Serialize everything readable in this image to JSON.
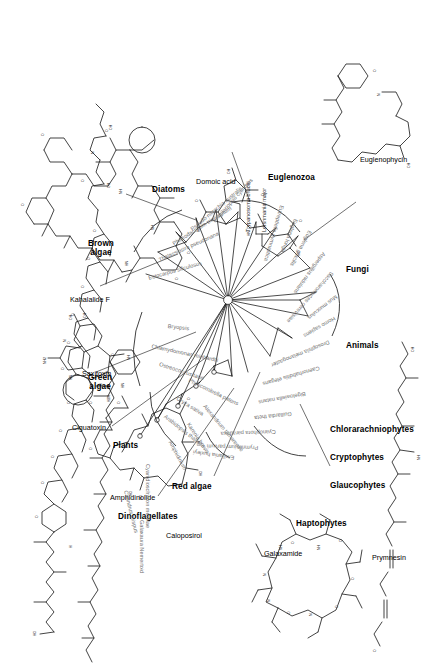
{
  "figure": {
    "type": "phylogenetic-tree-with-chemical-structures",
    "orientation": "rotated-90-ccw"
  },
  "groups": [
    {
      "id": "red-algae",
      "label": "Red algae"
    },
    {
      "id": "dinoflagellates",
      "label": "Dinoflagellates"
    },
    {
      "id": "plants",
      "label": "Plants"
    },
    {
      "id": "green-algae",
      "label": "Green\nalgae"
    },
    {
      "id": "brown-algae",
      "label": "Brown\nalgae"
    },
    {
      "id": "diatoms",
      "label": "Diatoms"
    },
    {
      "id": "euglenozoa",
      "label": "Euglenozoa"
    },
    {
      "id": "fungi",
      "label": "Fungi"
    },
    {
      "id": "animals",
      "label": "Animals"
    },
    {
      "id": "chlorarachniophytes",
      "label": "Chlorarachniophytes"
    },
    {
      "id": "cryptophytes",
      "label": "Cryptophytes"
    },
    {
      "id": "glaucophytes",
      "label": "Glaucophytes"
    },
    {
      "id": "haptophytes",
      "label": "Haptophytes"
    }
  ],
  "taxa": [
    {
      "id": "t01",
      "name": "Galaxaura Nemertoid",
      "group": "red-algae"
    },
    {
      "id": "t02",
      "name": "Chondrus crispus",
      "group": "red-algae"
    },
    {
      "id": "t03",
      "name": "Cyanidioschyzon merolae",
      "group": "red-algae"
    },
    {
      "id": "t04",
      "name": "Amphidinium",
      "group": "dinoflagellates"
    },
    {
      "id": "t05",
      "name": "Karenia brevis",
      "group": "dinoflagellates"
    },
    {
      "id": "t06",
      "name": "Alexandrium tamarense",
      "group": "dinoflagellates"
    },
    {
      "id": "t07",
      "name": "Arabidopsis thaliana",
      "group": "plants"
    },
    {
      "id": "t08",
      "name": "Oryza sativa",
      "group": "plants"
    },
    {
      "id": "t09",
      "name": "Physcomitrella patens",
      "group": "plants"
    },
    {
      "id": "t10",
      "name": "Ostreococcus tauri",
      "group": "green-algae"
    },
    {
      "id": "t11",
      "name": "Chlamydomonas reinhardtii",
      "group": "green-algae"
    },
    {
      "id": "t12",
      "name": "Bryopsis",
      "group": "green-algae"
    },
    {
      "id": "t13",
      "name": "Ectocarpus siliculosus",
      "group": "brown-algae"
    },
    {
      "id": "t14",
      "name": "Thalassiosira pseudonana",
      "group": "diatoms"
    },
    {
      "id": "t15",
      "name": "Phaeodactylum tricornutum",
      "group": "diatoms"
    },
    {
      "id": "t16",
      "name": "Pseudo-nitzschia australis",
      "group": "diatoms"
    },
    {
      "id": "t17",
      "name": "Fragilariopsis cylindrus",
      "group": "diatoms"
    },
    {
      "id": "t18",
      "name": "Trypanosoma brucei",
      "group": "euglenozoa"
    },
    {
      "id": "t19",
      "name": "Leishmania major",
      "group": "euglenozoa"
    },
    {
      "id": "t20",
      "name": "Eutreptiella gymnastica",
      "group": "euglenozoa"
    },
    {
      "id": "t21",
      "name": "Euglena longa",
      "group": "euglenozoa"
    },
    {
      "id": "t22",
      "name": "Euglena gracilis",
      "group": "euglenozoa"
    },
    {
      "id": "t23",
      "name": "Aspergillus nidulans",
      "group": "fungi"
    },
    {
      "id": "t24",
      "name": "Saccharomyces cerevisiae",
      "group": "fungi"
    },
    {
      "id": "t25",
      "name": "Mus musculus",
      "group": "animals"
    },
    {
      "id": "t26",
      "name": "Homo sapiens",
      "group": "animals"
    },
    {
      "id": "t27",
      "name": "Drosophila melanogaster",
      "group": "animals"
    },
    {
      "id": "t28",
      "name": "Caenorhabditis elegans",
      "group": "animals"
    },
    {
      "id": "t29",
      "name": "Bigelowiella natans",
      "group": "chlorarachniophytes"
    },
    {
      "id": "t30",
      "name": "Guillardia theta",
      "group": "cryptophytes"
    },
    {
      "id": "t31",
      "name": "Cyanophora paradoxa",
      "group": "glaucophytes"
    },
    {
      "id": "t32",
      "name": "Prymnesium parvum",
      "group": "haptophytes"
    },
    {
      "id": "t33",
      "name": "Emiliania huxleyi",
      "group": "haptophytes"
    }
  ],
  "compounds": [
    {
      "id": "c1",
      "name": "Ciguatoxin",
      "source_group": "dinoflagellates"
    },
    {
      "id": "c2",
      "name": "Amphidinolide",
      "source_group": "dinoflagellates"
    },
    {
      "id": "c3",
      "name": "Caloposirol",
      "source_group": "red-algae"
    },
    {
      "id": "c4",
      "name": "Galaxamide",
      "source_group": "red-algae"
    },
    {
      "id": "c5",
      "name": "Prymnesin",
      "source_group": "haptophytes"
    },
    {
      "id": "c6",
      "name": "Saxitoxin",
      "source_group": "dinoflagellates"
    },
    {
      "id": "c7",
      "name": "Kahalalide F",
      "source_group": "green-algae"
    },
    {
      "id": "c8",
      "name": "Domoic acid",
      "source_group": "diatoms"
    },
    {
      "id": "c9",
      "name": "Euglenophycin",
      "source_group": "euglenozoa"
    }
  ],
  "colors": {
    "stroke": "#222222",
    "taxon_text": "#6f6f6f",
    "group_text": "#000000",
    "pointer": "#8a8a8a",
    "background": "#ffffff"
  }
}
